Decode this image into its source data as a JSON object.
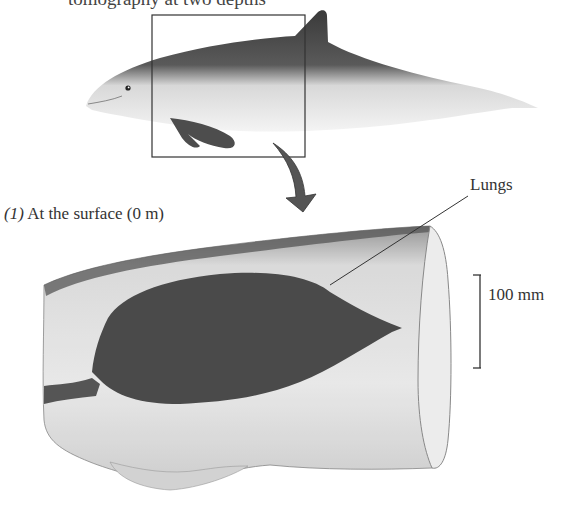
{
  "figure": {
    "caption_fragment": "tomography at two depths",
    "panel": {
      "number": "(1)",
      "label": "At the surface (0 m)"
    },
    "annotations": {
      "lungs": "Lungs",
      "scale_bar": "100 mm"
    },
    "illustration": {
      "subject": "harbor porpoise",
      "highlight_box": "inset box over thorax region",
      "arrow": "curved arrow pointing to CT scan"
    },
    "colors": {
      "lung_fill": "#4a4a4a",
      "body_dark": "#3c3c3c",
      "body_light": "#f2f2f2",
      "ct_outline": "#9a9a9a",
      "text": "#333333"
    }
  }
}
